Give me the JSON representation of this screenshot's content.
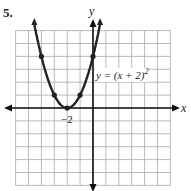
{
  "problem_number": "5.",
  "chart_data": {
    "type": "line",
    "title": "",
    "equation": "y = (x + 2)^2",
    "xlabel": "x",
    "ylabel": "y",
    "xlim": [
      -6,
      6
    ],
    "ylim": [
      -6,
      6
    ],
    "grid": true,
    "tick_labels": [
      {
        "x": -2,
        "y": 0,
        "text": "−2"
      }
    ],
    "points": [
      {
        "x": -4,
        "y": 4
      },
      {
        "x": -3,
        "y": 1
      },
      {
        "x": -2,
        "y": 0
      },
      {
        "x": -1,
        "y": 1
      },
      {
        "x": 0,
        "y": 4
      }
    ],
    "series": [
      {
        "name": "y = (x + 2)^2",
        "function": "(x+2)^2"
      }
    ]
  },
  "labels": {
    "x_axis": "x",
    "y_axis": "y",
    "vertex_tick": "−2",
    "eq_main": "y = (x + 2)",
    "eq_exp": "2"
  }
}
